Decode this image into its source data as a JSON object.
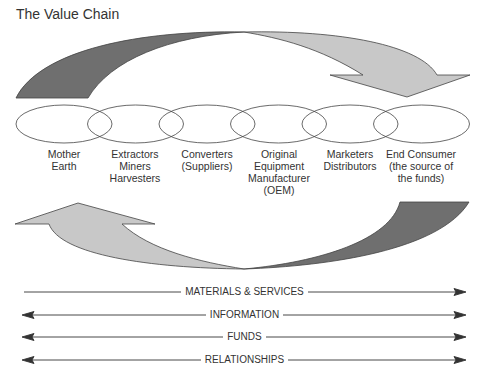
{
  "title": "The Value Chain",
  "colors": {
    "dark_arrow": "#6f6f6f",
    "light_arrow": "#c8c8c8",
    "outline": "#444444"
  },
  "stages": [
    {
      "label": "Mother\nEarth"
    },
    {
      "label": "Extractors\nMiners\nHarvesters"
    },
    {
      "label": "Converters\n(Suppliers)"
    },
    {
      "label": "Original\nEquipment\nManufacturer\n(OEM)"
    },
    {
      "label": "Marketers\nDistributors"
    },
    {
      "label": "End Consumer\n(the source of\nthe funds)"
    }
  ],
  "flows": [
    {
      "label": "MATERIALS & SERVICES",
      "direction": "right"
    },
    {
      "label": "INFORMATION",
      "direction": "both"
    },
    {
      "label": "FUNDS",
      "direction": "both"
    },
    {
      "label": "RELATIONSHIPS",
      "direction": "both"
    }
  ]
}
